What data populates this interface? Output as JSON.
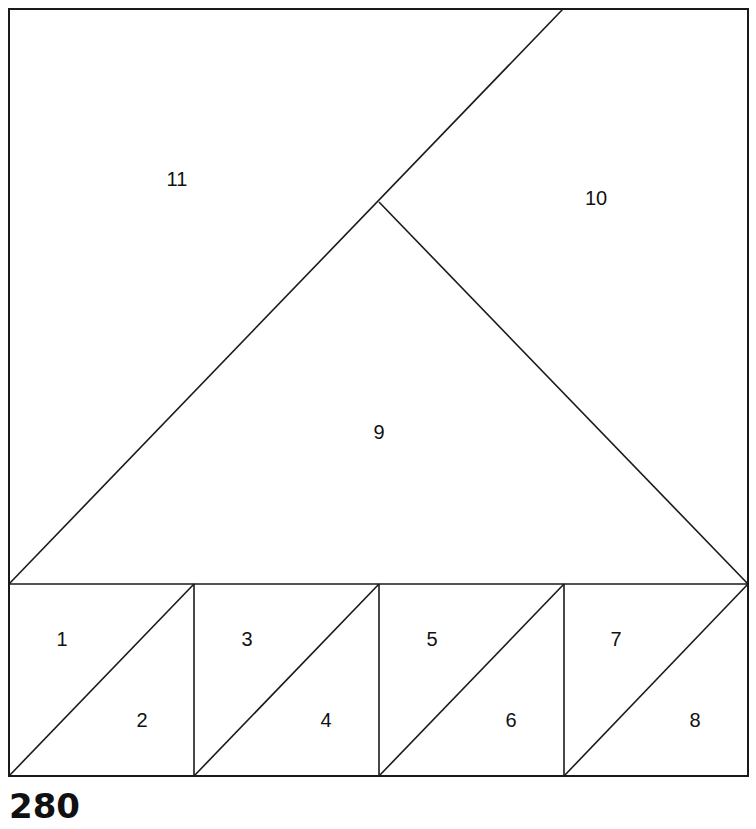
{
  "block": {
    "number": "280",
    "line_color": "#1a1a1a",
    "background": "#ffffff"
  },
  "pieces": [
    {
      "id": "1",
      "label": "1",
      "x": 62,
      "y": 641
    },
    {
      "id": "2",
      "label": "2",
      "x": 142,
      "y": 722
    },
    {
      "id": "3",
      "label": "3",
      "x": 247,
      "y": 641
    },
    {
      "id": "4",
      "label": "4",
      "x": 326,
      "y": 722
    },
    {
      "id": "5",
      "label": "5",
      "x": 432,
      "y": 641
    },
    {
      "id": "6",
      "label": "6",
      "x": 511,
      "y": 722
    },
    {
      "id": "7",
      "label": "7",
      "x": 616,
      "y": 641
    },
    {
      "id": "8",
      "label": "8",
      "x": 695,
      "y": 722
    },
    {
      "id": "9",
      "label": "9",
      "x": 379,
      "y": 434
    },
    {
      "id": "10",
      "label": "10",
      "x": 596,
      "y": 200
    },
    {
      "id": "11",
      "label": "11",
      "x": 177,
      "y": 181
    }
  ]
}
